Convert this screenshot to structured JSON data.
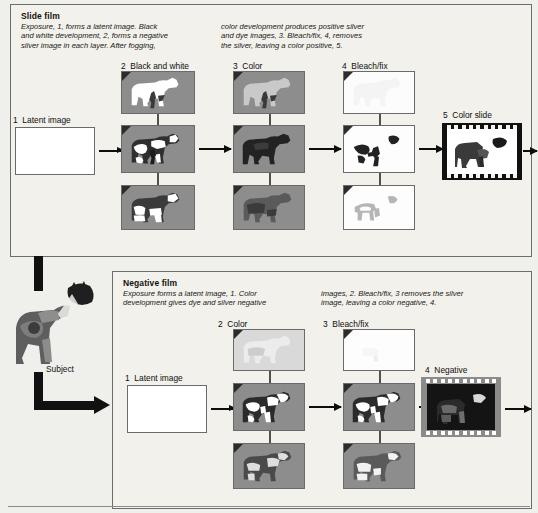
{
  "diagram": {
    "title_semantic": "color-film-processing-diagram",
    "subject": {
      "label": "Subject"
    },
    "slide_film": {
      "heading": "Slide film",
      "description_col1": "Exposure, 1, forms a latent image. Black\nand white development, 2, forms a negative\nsilver image in each layer. After fogging,",
      "description_col2": "color development produces positive silver\nand dye images, 3. Bleach/fix, 4, removes\nthe silver, leaving a color positive, 5.",
      "steps": [
        {
          "number": "1",
          "label": "Latent image"
        },
        {
          "number": "2",
          "label": "Black and white"
        },
        {
          "number": "3",
          "label": "Color"
        },
        {
          "number": "4",
          "label": "Bleach/fix"
        },
        {
          "number": "5",
          "label": "Color slide"
        }
      ]
    },
    "negative_film": {
      "heading": "Negative film",
      "description_col1": "Exposure forms a latent image, 1. Color\ndevelopment gives dye and silver negative",
      "description_col2": "images, 2. Bleach/fix, 3 removes the silver\nimage, leaving a color negative, 4.",
      "steps": [
        {
          "number": "1",
          "label": "Latent image"
        },
        {
          "number": "2",
          "label": "Color"
        },
        {
          "number": "3",
          "label": "Bleach/fix"
        },
        {
          "number": "4",
          "label": "Negative"
        }
      ]
    },
    "colors": {
      "page_background": "#efefeb",
      "panel_background": "#f2f1ec",
      "panel_border": "#6d6d6d",
      "emulsion_grey": "#8d8d8d",
      "emulsion_dark": "#3d3d3d",
      "emulsion_light": "#d6d6d6",
      "white": "#ffffff",
      "ink": "#111111",
      "filmstrip_black": "#111111",
      "filmstrip_grey": "#8b8b8b"
    }
  }
}
